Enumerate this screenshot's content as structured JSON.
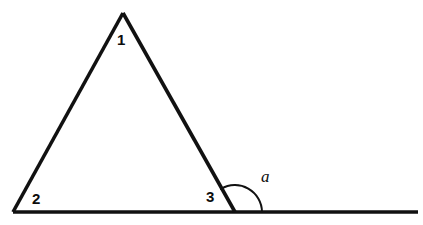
{
  "figure": {
    "background_color": "#ffffff",
    "stroke_color": "#111111",
    "labels": {
      "angle_1": "1",
      "angle_2": "2",
      "angle_3": "3",
      "exterior_angle": "a"
    },
    "icons": {
      "arc": "angle-arc-icon"
    }
  },
  "chart_data": {
    "type": "diagram",
    "xlabel": "",
    "ylabel": "",
    "points": {
      "apex": [
        123,
        13
      ],
      "left_vertex": [
        13,
        212
      ],
      "right_vertex": [
        235,
        212
      ],
      "baseline_end": [
        418,
        212
      ]
    },
    "segments": [
      {
        "name": "left-side",
        "from": [
          13,
          212
        ],
        "to": [
          123,
          13
        ]
      },
      {
        "name": "right-side",
        "from": [
          123,
          13
        ],
        "to": [
          235,
          212
        ]
      },
      {
        "name": "baseline",
        "from": [
          13,
          212
        ],
        "to": [
          418,
          212
        ]
      }
    ],
    "arc": {
      "name": "exterior-angle-arc",
      "center": [
        235,
        212
      ],
      "radius": 27,
      "start": [
        221,
        189
      ],
      "end": [
        262,
        212
      ]
    },
    "annotations": [
      {
        "text": "1",
        "x": 122,
        "y": 40,
        "style": "bold"
      },
      {
        "text": "2",
        "x": 37,
        "y": 199,
        "style": "bold"
      },
      {
        "text": "3",
        "x": 211,
        "y": 197,
        "style": "bold"
      },
      {
        "text": "a",
        "x": 267,
        "y": 177,
        "style": "italic"
      }
    ]
  }
}
